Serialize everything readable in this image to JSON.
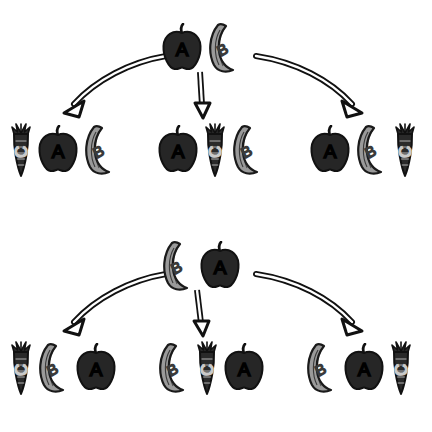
{
  "canvas": {
    "width": 432,
    "height": 432,
    "background": "#ffffff"
  },
  "palette": {
    "apple_fill": "#262626",
    "apple_outline": "#111111",
    "apple_letter": "#000000",
    "banana_fill": "#9a9a9a",
    "banana_outline": "#1a1a1a",
    "banana_letter": "#3a3a3a",
    "carrot_fill": "#2a2a2a",
    "carrot_outline": "#111111",
    "carrot_letter": "#c9c9c9",
    "arrow_fill": "#ffffff",
    "arrow_outline": "#111111"
  },
  "icons": {
    "apple": "apple-icon",
    "banana": "banana-icon",
    "carrot": "carrot-icon",
    "arrow_curve_left": "curved-arrow-left-icon",
    "arrow_straight_down": "straight-arrow-down-icon",
    "arrow_curve_right": "curved-arrow-right-icon"
  },
  "labels": {
    "apple": "A",
    "banana": "B",
    "carrot": "C"
  },
  "sections": [
    {
      "id": "section-1",
      "source": {
        "name": "source-sequence-1",
        "items": [
          {
            "type": "apple",
            "letter": "A"
          },
          {
            "type": "banana",
            "letter": "B"
          }
        ]
      },
      "arrows": [
        {
          "name": "arrow-to-option-1",
          "kind": "curve-left"
        },
        {
          "name": "arrow-to-option-2",
          "kind": "straight-down"
        },
        {
          "name": "arrow-to-option-3",
          "kind": "curve-right"
        }
      ],
      "options": [
        {
          "name": "option-1",
          "items": [
            {
              "type": "carrot",
              "letter": "C"
            },
            {
              "type": "apple",
              "letter": "A"
            },
            {
              "type": "banana",
              "letter": "B"
            }
          ]
        },
        {
          "name": "option-2",
          "items": [
            {
              "type": "apple",
              "letter": "A"
            },
            {
              "type": "carrot",
              "letter": "C"
            },
            {
              "type": "banana",
              "letter": "B"
            }
          ]
        },
        {
          "name": "option-3",
          "items": [
            {
              "type": "apple",
              "letter": "A"
            },
            {
              "type": "banana",
              "letter": "B"
            },
            {
              "type": "carrot",
              "letter": "C"
            }
          ]
        }
      ]
    },
    {
      "id": "section-2",
      "source": {
        "name": "source-sequence-2",
        "items": [
          {
            "type": "banana",
            "letter": "B"
          },
          {
            "type": "apple",
            "letter": "A"
          }
        ]
      },
      "arrows": [
        {
          "name": "arrow-to-option-1",
          "kind": "curve-left"
        },
        {
          "name": "arrow-to-option-2",
          "kind": "straight-down"
        },
        {
          "name": "arrow-to-option-3",
          "kind": "curve-right"
        }
      ],
      "options": [
        {
          "name": "option-1",
          "items": [
            {
              "type": "carrot",
              "letter": "C"
            },
            {
              "type": "banana",
              "letter": "B"
            },
            {
              "type": "apple",
              "letter": "A"
            }
          ]
        },
        {
          "name": "option-2",
          "items": [
            {
              "type": "banana",
              "letter": "B"
            },
            {
              "type": "carrot",
              "letter": "C"
            },
            {
              "type": "apple",
              "letter": "A"
            }
          ]
        },
        {
          "name": "option-3",
          "items": [
            {
              "type": "banana",
              "letter": "B"
            },
            {
              "type": "apple",
              "letter": "A"
            },
            {
              "type": "carrot",
              "letter": "C"
            }
          ]
        }
      ]
    }
  ],
  "geometry": {
    "source_pos": {
      "left": 160,
      "top": 22,
      "width": 112,
      "height": 56
    },
    "option_pos": [
      {
        "left": 8,
        "top": 122,
        "width": 120,
        "height": 66
      },
      {
        "left": 156,
        "top": 122,
        "width": 120,
        "height": 66
      },
      {
        "left": 308,
        "top": 122,
        "width": 120,
        "height": 66
      }
    ]
  }
}
